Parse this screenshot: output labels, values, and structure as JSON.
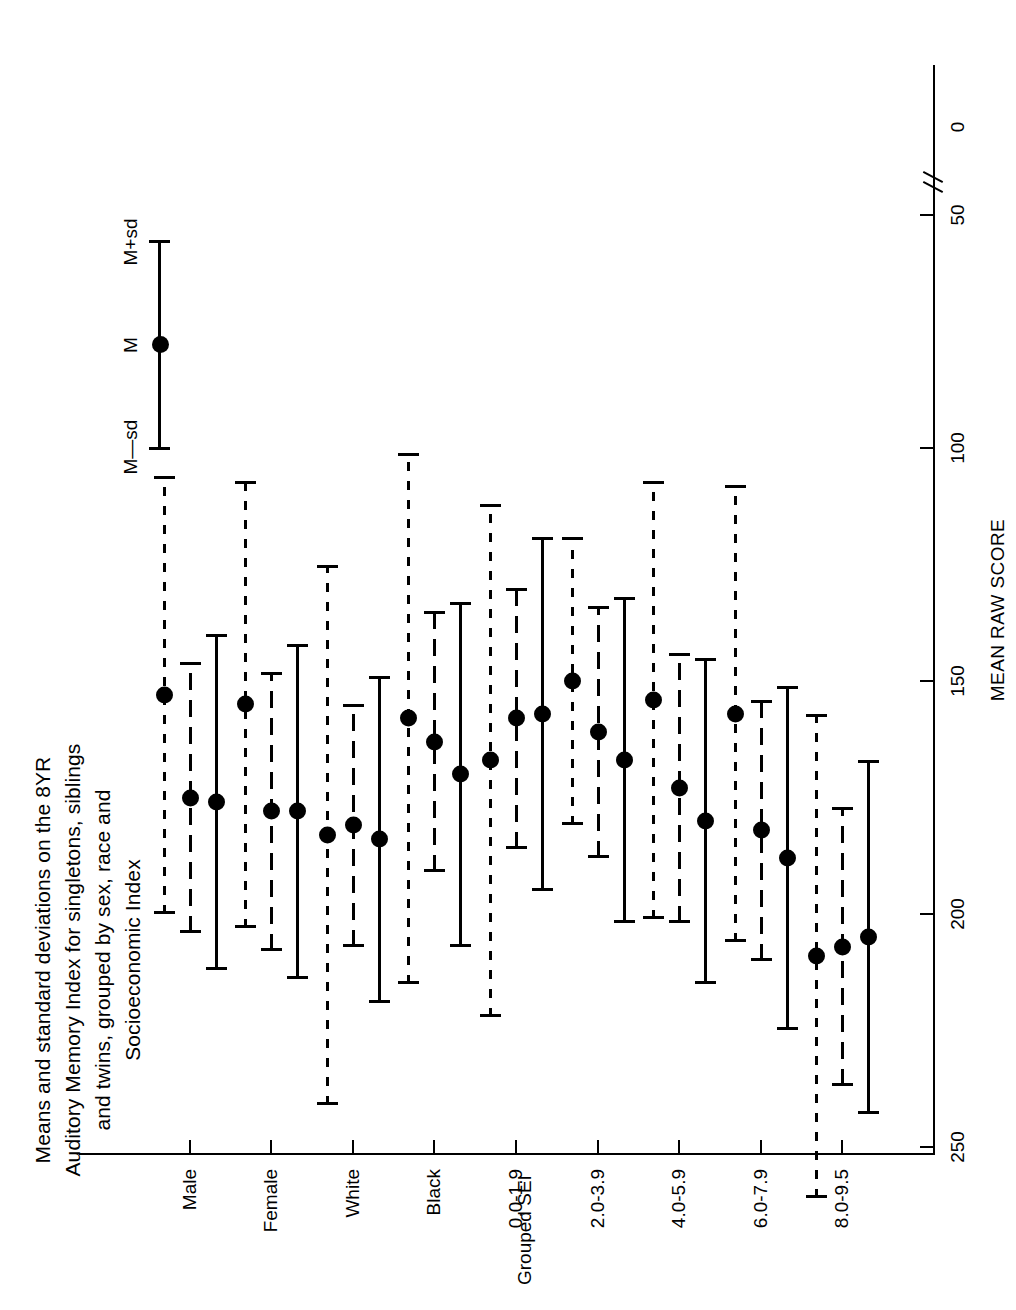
{
  "chart_data": {
    "type": "scatter",
    "title": "Means and standard deviations on the 8YR Auditory Memory Index for singletons, siblings and twins, grouped by sex, race and Socioeconomic Index",
    "title_lines": [
      "Means and standard deviations on the 8YR",
      "Auditory Memory Index for singletons, siblings",
      "and twins, grouped by sex, race and",
      "Socioeconomic Index"
    ],
    "xlabel": "Grouped SEI",
    "ylabel": "MEAN RAW SCORE",
    "ylim": [
      50,
      250
    ],
    "yticks": [
      250,
      200,
      150,
      100,
      50,
      0
    ],
    "ytick_labels": [
      "250",
      "200",
      "150",
      "100",
      "50",
      "0"
    ],
    "axis_break": true,
    "grid": false,
    "orientation": "horizontal-error-bars",
    "categories": [
      "Male",
      "Female",
      "White",
      "Black",
      "0.0-1.9",
      "2.0-3.9",
      "4.0-5.9",
      "6.0-7.9",
      "8.0-9.5"
    ],
    "legend_position": "bottom-right",
    "legend": [
      {
        "name": "singletons",
        "style": "solid"
      },
      {
        "name": "siblings",
        "style": "dash"
      },
      {
        "name": "twins",
        "style": "dotdash"
      }
    ],
    "marker_legend": {
      "upper": "M+sd",
      "center": "M",
      "lower": "M—sd"
    },
    "series": [
      {
        "name": "singletons",
        "style": "solid",
        "means": [
          176,
          178,
          184,
          170,
          157,
          167,
          180,
          188,
          205
        ],
        "lowers": [
          140,
          142,
          149,
          133,
          119,
          132,
          145,
          151,
          167
        ],
        "uppers": [
          212,
          214,
          219,
          207,
          195,
          202,
          215,
          225,
          243
        ]
      },
      {
        "name": "siblings",
        "style": "dash",
        "means": [
          175,
          178,
          181,
          163,
          158,
          161,
          173,
          182,
          207
        ],
        "lowers": [
          146,
          148,
          155,
          135,
          130,
          134,
          144,
          154,
          177
        ],
        "uppers": [
          204,
          208,
          207,
          191,
          186,
          188,
          202,
          210,
          237
        ]
      },
      {
        "name": "twins",
        "style": "dotdash",
        "means": [
          153,
          155,
          183,
          158,
          167,
          150,
          154,
          157,
          209
        ],
        "lowers": [
          106,
          107,
          125,
          101,
          112,
          119,
          107,
          108,
          157
        ],
        "uppers": [
          200,
          203,
          241,
          215,
          222,
          181,
          201,
          206,
          261
        ]
      }
    ]
  }
}
